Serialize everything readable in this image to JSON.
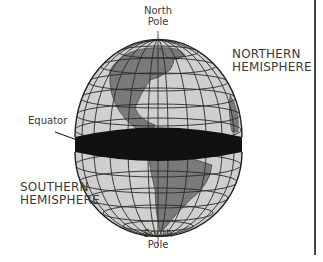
{
  "diagram": {
    "labels": {
      "north_pole_line1": "North",
      "north_pole_line2": "Pole",
      "south_pole_line1": "South",
      "south_pole_line2": "Pole",
      "equator": "Equator",
      "northern_line1": "NORTHERN",
      "northern_line2": "HEMISPHERE",
      "southern_line1": "SOUTHERN",
      "southern_line2": "HEMISPHERE"
    },
    "colors": {
      "ocean": "#cfcfcf",
      "land": "#7a7a7a",
      "grid": "#2a2a2a",
      "equator_band": "#111111",
      "text": "#3a3a3a"
    }
  }
}
